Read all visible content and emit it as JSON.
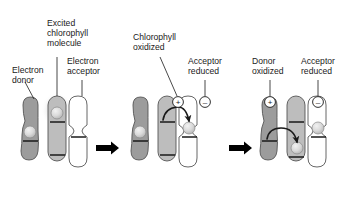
{
  "figure": {
    "background_color": "#ffffff"
  },
  "colors": {
    "donor_fill": "#9c9c9c",
    "chlorophyll_fill": "#bdbdbd",
    "acceptor_fill": "#ffffff",
    "outline": "#555555",
    "text": "#1a1a1a",
    "arrow": "#000000",
    "electron_fill": "#d4d4d4",
    "glow": "#ebebeb"
  },
  "labels": {
    "electron_donor": {
      "line1": "Electron",
      "line2": "donor"
    },
    "excited_chlorophyll": {
      "line1": "Excited",
      "line2": "chlorophyll",
      "line3": "molecule"
    },
    "electron_acceptor": {
      "line1": "Electron",
      "line2": "acceptor"
    },
    "chlorophyll_oxidized": {
      "line1": "Chlorophyll",
      "line2": "oxidized"
    },
    "acceptor_reduced_mid": {
      "line1": "Acceptor",
      "line2": "reduced"
    },
    "donor_oxidized": {
      "line1": "Donor",
      "line2": "oxidized"
    },
    "acceptor_reduced_right": {
      "line1": "Acceptor",
      "line2": "reduced"
    }
  },
  "signs": {
    "plus": "+",
    "minus": "–"
  },
  "panels": [
    {
      "id": "panel-1",
      "name": "excited-state",
      "description": "Electron donor, excited chlorophyll molecule with glow, and empty electron acceptor",
      "molecules": [
        {
          "role": "electron-donor",
          "fill": "#9c9c9c",
          "electron": true,
          "electron_position": "low",
          "charge": null
        },
        {
          "role": "chlorophyll",
          "fill": "#bdbdbd",
          "electron": true,
          "electron_position": "high",
          "charge": null,
          "glow": true
        },
        {
          "role": "electron-acceptor",
          "fill": "#ffffff",
          "electron": false,
          "electron_position": "mid",
          "charge": null
        }
      ],
      "transfer_arrow": null
    },
    {
      "id": "panel-2",
      "name": "chlorophyll-oxidized",
      "description": "Chlorophyll loses electron to acceptor; chlorophyll becomes positive, acceptor negative",
      "molecules": [
        {
          "role": "electron-donor",
          "fill": "#9c9c9c",
          "electron": true,
          "electron_position": "low",
          "charge": null
        },
        {
          "role": "chlorophyll",
          "fill": "#bdbdbd",
          "electron": false,
          "electron_position": "high",
          "charge": "+"
        },
        {
          "role": "electron-acceptor",
          "fill": "#ffffff",
          "electron": true,
          "electron_position": "mid",
          "charge": "–"
        }
      ],
      "transfer_arrow": {
        "from": "chlorophyll",
        "to": "electron-acceptor",
        "direction": "rightward-arc"
      }
    },
    {
      "id": "panel-3",
      "name": "donor-oxidized",
      "description": "Donor gives electron to chlorophyll; donor becomes positive, acceptor remains negative",
      "molecules": [
        {
          "role": "electron-donor",
          "fill": "#9c9c9c",
          "electron": false,
          "electron_position": "low",
          "charge": "+"
        },
        {
          "role": "chlorophyll",
          "fill": "#bdbdbd",
          "electron": true,
          "electron_position": "low",
          "charge": null
        },
        {
          "role": "electron-acceptor",
          "fill": "#ffffff",
          "electron": true,
          "electron_position": "mid",
          "charge": "–"
        }
      ],
      "transfer_arrow": {
        "from": "electron-donor",
        "to": "chlorophyll",
        "direction": "rightward-arc-down"
      }
    }
  ],
  "step_arrows": [
    {
      "id": "step-arrow-1",
      "between": [
        "panel-1",
        "panel-2"
      ]
    },
    {
      "id": "step-arrow-2",
      "between": [
        "panel-2",
        "panel-3"
      ]
    }
  ]
}
